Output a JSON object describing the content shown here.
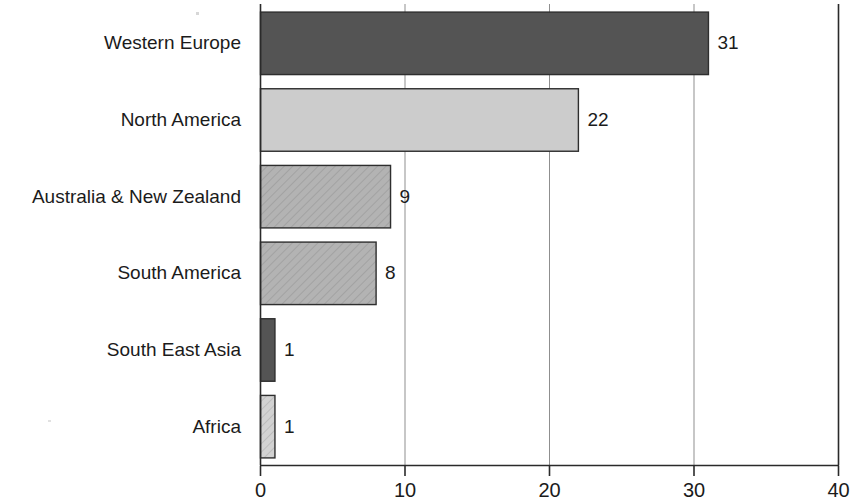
{
  "chart_data": {
    "type": "bar",
    "orientation": "horizontal",
    "title": "",
    "subtitle": "",
    "xlabel": "",
    "ylabel": "",
    "categories": [
      "Western Europe",
      "North America",
      "Australia & New Zealand",
      "South America",
      "South East Asia",
      "Africa"
    ],
    "values": [
      31,
      22,
      9,
      8,
      1,
      1
    ],
    "value_labels": [
      "31",
      "22",
      "9",
      "8",
      "1",
      "1"
    ],
    "xlim": [
      0,
      40
    ],
    "xticks": [
      0,
      10,
      20,
      30,
      40
    ],
    "xtick_labels": [
      "0",
      "10",
      "20",
      "30",
      "40"
    ],
    "grid": true,
    "grid_axis": "x",
    "legend": "none",
    "bar_colors": [
      "#545454",
      "#cccccc",
      "#b0b0b0",
      "#b0b0b0",
      "#545454",
      "#c6c6c6"
    ],
    "bar_patterns": [
      "solid",
      "solid",
      "diagonal-hatch",
      "diagonal-hatch",
      "solid",
      "diagonal-hatch"
    ],
    "bar_outline_color": "#2e2e2e",
    "axis_color": "#2a2a2a",
    "gridline_color": "#8f8f8f",
    "background_color": "#ffffff",
    "text_color": "#1b1b1b"
  }
}
